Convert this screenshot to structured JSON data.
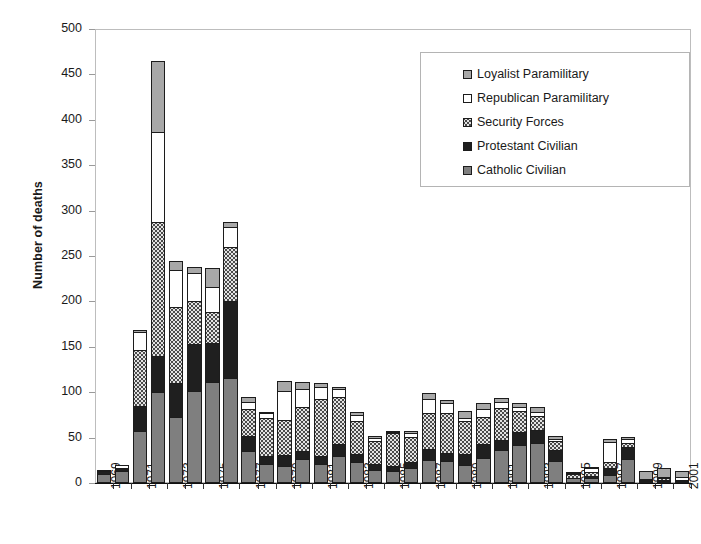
{
  "chart_data": {
    "type": "bar",
    "subtype": "stacked-vertical",
    "title": "",
    "xlabel": "",
    "ylabel": "Number of deaths",
    "ylim": [
      0,
      500
    ],
    "ytick_step": 50,
    "yticks": [
      "500",
      "450",
      "400",
      "350",
      "300",
      "250",
      "200",
      "150",
      "100",
      "50",
      "0"
    ],
    "grid": false,
    "legend_position": "top-right",
    "categories": [
      "1969",
      "1970",
      "1971",
      "1972",
      "1973",
      "1974",
      "1975",
      "1976",
      "1977",
      "1978",
      "1979",
      "1980",
      "1981",
      "1982",
      "1983",
      "1984",
      "1985",
      "1986",
      "1987",
      "1988",
      "1989",
      "1990",
      "1991",
      "1992",
      "1993",
      "1994",
      "1995",
      "1996",
      "1997",
      "1998",
      "1999",
      "2000",
      "2001"
    ],
    "xtick_labels_shown": [
      "1969",
      "1971",
      "1973",
      "1975",
      "1977",
      "1979",
      "1981",
      "1983",
      "1985",
      "1987",
      "1989",
      "1991",
      "1993",
      "1995",
      "1997",
      "1999",
      "2001"
    ],
    "series": [
      {
        "name": "Catholic Civilian",
        "color": "#7f7f7f",
        "pattern": "solid-gray",
        "values": [
          10,
          13,
          57,
          100,
          73,
          101,
          111,
          116,
          35,
          21,
          19,
          26,
          21,
          30,
          23,
          14,
          13,
          17,
          25,
          24,
          20,
          28,
          36,
          42,
          44,
          24,
          5,
          6,
          9,
          26,
          1,
          2,
          1
        ]
      },
      {
        "name": "Protestant Civilian",
        "color": "#1f1f1f",
        "pattern": "solid-black",
        "values": [
          3,
          3,
          28,
          40,
          37,
          52,
          43,
          84,
          17,
          9,
          12,
          9,
          9,
          13,
          9,
          7,
          6,
          6,
          13,
          9,
          12,
          15,
          11,
          14,
          14,
          12,
          1,
          2,
          8,
          14,
          1,
          1,
          1
        ]
      },
      {
        "name": "Security Forces",
        "color": "#e3e3e3",
        "pattern": "dotted",
        "values": [
          0,
          0,
          61,
          148,
          84,
          48,
          34,
          60,
          29,
          42,
          38,
          49,
          63,
          52,
          36,
          25,
          36,
          28,
          39,
          44,
          36,
          30,
          36,
          23,
          16,
          10,
          4,
          4,
          6,
          4,
          1,
          2,
          1
        ]
      },
      {
        "name": "Republican Paramilitary",
        "color": "#ffffff",
        "pattern": "white",
        "values": [
          1,
          4,
          20,
          99,
          41,
          30,
          28,
          22,
          8,
          5,
          32,
          20,
          13,
          9,
          7,
          4,
          1,
          4,
          16,
          11,
          4,
          8,
          6,
          5,
          4,
          3,
          1,
          4,
          22,
          4,
          1,
          2,
          4
        ]
      },
      {
        "name": "Loyalist Paramilitary",
        "color": "#a8a8a8",
        "pattern": "solid-lightgray",
        "values": [
          0,
          0,
          2,
          78,
          10,
          7,
          21,
          5,
          6,
          1,
          11,
          7,
          4,
          2,
          3,
          1,
          1,
          2,
          6,
          3,
          7,
          7,
          5,
          4,
          6,
          3,
          1,
          2,
          4,
          3,
          9,
          9,
          6
        ]
      }
    ],
    "totals": [
      14,
      20,
      168,
      465,
      245,
      238,
      237,
      287,
      95,
      78,
      112,
      111,
      110,
      106,
      78,
      51,
      57,
      57,
      99,
      91,
      79,
      88,
      94,
      88,
      84,
      52,
      12,
      18,
      49,
      51,
      13,
      16,
      13
    ]
  },
  "legend": {
    "items": [
      {
        "label": "Loyalist Paramilitary",
        "swatch": "sw-loyalist"
      },
      {
        "label": "Republican Paramilitary",
        "swatch": "sw-republican"
      },
      {
        "label": "Security Forces",
        "swatch": "sw-security"
      },
      {
        "label": "Protestant Civilian",
        "swatch": "sw-protestant"
      },
      {
        "label": "Catholic Civilian",
        "swatch": "sw-catholic"
      }
    ]
  }
}
